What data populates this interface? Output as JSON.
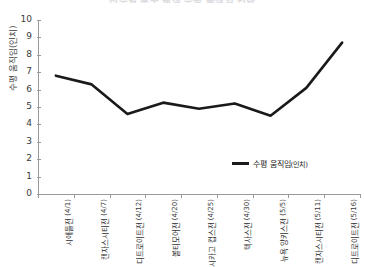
{
  "chart_data": {
    "type": "line",
    "title": "선수별 투구 궤적 수평 움직임 변화",
    "xlabel": "",
    "ylabel": "수평 움직임(인치)",
    "ylim": [
      0,
      10
    ],
    "ytick_step": 1,
    "yticks": [
      "0",
      "1",
      "2",
      "3",
      "4",
      "5",
      "6",
      "7",
      "8",
      "9",
      "10"
    ],
    "grid": false,
    "legend_position": "inside-bottom-right",
    "categories": [
      "시애틀전",
      "캔자스시티전",
      "디트로이트전",
      "볼티모어전",
      "시카고 컵스전",
      "텍사스전",
      "뉴욕 양키스전",
      "캔자스시티전",
      "디트로이트전"
    ],
    "category_dates": [
      "(4/1)",
      "(4/7)",
      "(4/12)",
      "(4/20)",
      "(4/25)",
      "(4/30)",
      "(5/5)",
      "(5/11)",
      "(5/16)"
    ],
    "series": [
      {
        "name": "수평 움직임(인치)",
        "unit": "(인치)",
        "name_base": "수평 움직임",
        "color": "#1a1a1a",
        "values": [
          6.8,
          6.3,
          4.6,
          5.25,
          4.9,
          5.2,
          4.5,
          6.1,
          8.7
        ]
      }
    ]
  },
  "legend": {
    "entries": [
      {
        "label_base": "수평 움직임",
        "label_unit": "(인치)",
        "color": "#1a1a1a"
      }
    ]
  }
}
